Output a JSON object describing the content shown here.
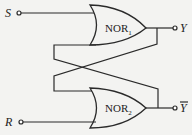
{
  "diagram": {
    "type": "SR latch (cross-coupled NOR gates)",
    "inputs": [
      {
        "label": "S"
      },
      {
        "label": "R"
      }
    ],
    "outputs": [
      {
        "label": "Y"
      },
      {
        "label": "Y",
        "overbar": true
      }
    ],
    "gates": [
      {
        "name": "NOR",
        "subscript": "1"
      },
      {
        "name": "NOR",
        "subscript": "2"
      }
    ]
  }
}
